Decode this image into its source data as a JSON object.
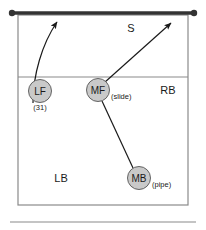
{
  "diagram": {
    "colors": {
      "net": "#333333",
      "court_line": "#8a8a8a",
      "player_fill": "#c9c9c9",
      "player_stroke": "#555555",
      "arrow": "#1a1a1a",
      "text": "#1a1a1a",
      "background": "#ffffff"
    },
    "net": {
      "name": "net",
      "x1": 12,
      "y1": 13,
      "x2": 194,
      "y2": 13,
      "post_radius": 3.2
    },
    "court": {
      "x": 18,
      "y": 15,
      "width": 170,
      "height": 190,
      "attack_line_y": 77
    },
    "baseline_rule": {
      "x1": 10,
      "y1": 222,
      "x2": 196,
      "y2": 222
    },
    "zones": [
      {
        "id": "S",
        "label": "S",
        "x": 131,
        "y": 32
      },
      {
        "id": "RB",
        "label": "RB",
        "x": 168,
        "y": 94
      },
      {
        "id": "LB",
        "label": "LB",
        "x": 61,
        "y": 182
      }
    ],
    "players": [
      {
        "id": "LF",
        "label": "LF",
        "note": "(31)",
        "cx": 40,
        "cy": 91,
        "r": 11.5,
        "note_x": 40,
        "note_y": 110,
        "note_anchor": "middle"
      },
      {
        "id": "MF",
        "label": "MF",
        "note": "(slide)",
        "cx": 98,
        "cy": 90,
        "r": 11.5,
        "note_x": 111,
        "note_y": 99,
        "note_anchor": "start"
      },
      {
        "id": "MB",
        "label": "MB",
        "note": "(pipe)",
        "cx": 139,
        "cy": 178,
        "r": 11.5,
        "note_x": 152,
        "note_y": 187,
        "note_anchor": "start"
      }
    ],
    "movements": [
      {
        "id": "lf-approach",
        "from": "LF",
        "to": "net-left",
        "type": "curved-arrow",
        "path": "M 33 103 C 33 75, 42 44, 57 22"
      },
      {
        "id": "mf-slide",
        "from": "MF",
        "to": "net-right",
        "type": "straight-arrow",
        "path": "M 95 91 L 171 23"
      },
      {
        "id": "mb-pipe",
        "from": "MB",
        "to": "MF",
        "type": "line",
        "path": "M 133 168 L 102 101"
      }
    ]
  }
}
